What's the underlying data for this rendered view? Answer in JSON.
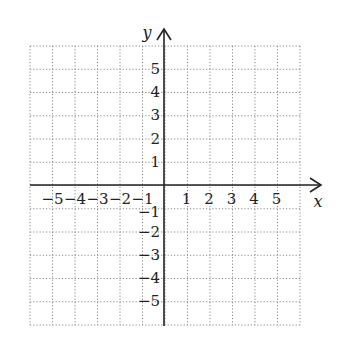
{
  "diagram": {
    "type": "coordinate-grid",
    "x_axis_label": "x",
    "y_axis_label": "y",
    "x_range": [
      -6,
      6
    ],
    "y_range": [
      -6,
      6
    ],
    "grid_style": "dotted",
    "x_tick_labels": [
      "−5",
      "−4",
      "−3",
      "−2",
      "−1",
      "1",
      "2",
      "3",
      "4",
      "5"
    ],
    "x_tick_values": [
      -5,
      -4,
      -3,
      -2,
      -1,
      1,
      2,
      3,
      4,
      5
    ],
    "y_tick_labels": [
      "5",
      "4",
      "3",
      "2",
      "1",
      "−1",
      "−2",
      "−3",
      "−4",
      "−5"
    ],
    "y_tick_values": [
      5,
      4,
      3,
      2,
      1,
      -1,
      -2,
      -3,
      -4,
      -5
    ],
    "colors": {
      "axis": "#222222",
      "grid": "#8a8a8a",
      "background": "#ffffff"
    }
  }
}
